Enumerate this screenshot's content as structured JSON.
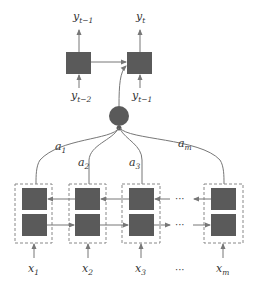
{
  "diagram": {
    "type": "attention-encoder-decoder",
    "colors": {
      "box_fill": "#5a5a5a",
      "line": "#777777",
      "dashed_border": "#888888",
      "text": "#333333",
      "background": "#ffffff"
    },
    "decoder": {
      "cells": [
        {
          "output": {
            "base": "y",
            "sub": "t−1"
          },
          "input": {
            "base": "y",
            "sub": "t−2"
          }
        },
        {
          "output": {
            "base": "y",
            "sub": "t"
          },
          "input": {
            "base": "y",
            "sub": "t−1"
          }
        }
      ]
    },
    "attention_node": {
      "shape": "circle"
    },
    "attention_weights": [
      {
        "base": "a",
        "sub": "1"
      },
      {
        "base": "a",
        "sub": "2"
      },
      {
        "base": "a",
        "sub": "3"
      },
      {
        "base": "a",
        "sub": "m"
      }
    ],
    "encoder": {
      "inputs": [
        {
          "base": "x",
          "sub": "1"
        },
        {
          "base": "x",
          "sub": "2"
        },
        {
          "base": "x",
          "sub": "3"
        },
        {
          "base": "x",
          "sub": "m"
        }
      ],
      "ellipsis": "···",
      "bidirectional": true
    }
  }
}
